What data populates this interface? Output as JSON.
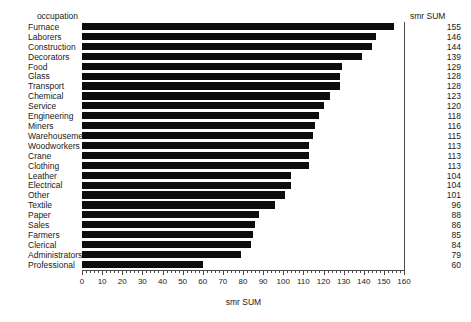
{
  "headers": {
    "category_header": "occupation",
    "value_header": "smr SUM"
  },
  "axis": {
    "x_title": "smr SUM",
    "ticks": [
      0,
      10,
      20,
      30,
      40,
      50,
      60,
      70,
      80,
      90,
      100,
      110,
      120,
      130,
      140,
      150,
      160
    ]
  },
  "colors": {
    "bar": "#0d0d0d",
    "axis": "#4a4a4a",
    "text": "#1a1a1a",
    "background": "#ffffff"
  },
  "chart_data": {
    "type": "bar",
    "orientation": "horizontal",
    "title": "",
    "xlabel": "smr SUM",
    "ylabel": "occupation",
    "xlim": [
      0,
      160
    ],
    "grid": false,
    "legend": "none",
    "categories": [
      "Furnace",
      "Laborers",
      "Construction",
      "Decorators",
      "Food",
      "Glass",
      "Transport",
      "Chemical",
      "Service",
      "Engineering",
      "Miners",
      "Warehousemen",
      "Woodworkers",
      "Crane",
      "Clothing",
      "Leather",
      "Electrical",
      "Other",
      "Textile",
      "Paper",
      "Sales",
      "Farmers",
      "Clerical",
      "Administrators",
      "Professional"
    ],
    "values": [
      155,
      146,
      144,
      139,
      129,
      128,
      128,
      123,
      120,
      118,
      116,
      115,
      113,
      113,
      113,
      104,
      104,
      101,
      96,
      88,
      86,
      85,
      84,
      79,
      60
    ]
  },
  "rows": [
    {
      "label": "Furnace",
      "value": 155
    },
    {
      "label": "Laborers",
      "value": 146
    },
    {
      "label": "Construction",
      "value": 144
    },
    {
      "label": "Decorators",
      "value": 139
    },
    {
      "label": "Food",
      "value": 129
    },
    {
      "label": "Glass",
      "value": 128
    },
    {
      "label": "Transport",
      "value": 128
    },
    {
      "label": "Chemical",
      "value": 123
    },
    {
      "label": "Service",
      "value": 120
    },
    {
      "label": "Engineering",
      "value": 118
    },
    {
      "label": "Miners",
      "value": 116
    },
    {
      "label": "Warehousemen",
      "value": 115
    },
    {
      "label": "Woodworkers",
      "value": 113
    },
    {
      "label": "Crane",
      "value": 113
    },
    {
      "label": "Clothing",
      "value": 113
    },
    {
      "label": "Leather",
      "value": 104
    },
    {
      "label": "Electrical",
      "value": 104
    },
    {
      "label": "Other",
      "value": 101
    },
    {
      "label": "Textile",
      "value": 96
    },
    {
      "label": "Paper",
      "value": 88
    },
    {
      "label": "Sales",
      "value": 86
    },
    {
      "label": "Farmers",
      "value": 85
    },
    {
      "label": "Clerical",
      "value": 84
    },
    {
      "label": "Administrators",
      "value": 79
    },
    {
      "label": "Professional",
      "value": 60
    }
  ]
}
